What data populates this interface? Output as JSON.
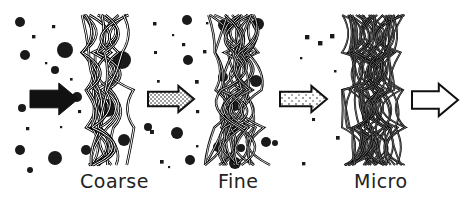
{
  "diagram": {
    "stages": [
      {
        "name": "Coarse",
        "label": "Coarse",
        "density": "coarse"
      },
      {
        "name": "Fine",
        "label": "Fine",
        "density": "fine"
      },
      {
        "name": "Micro",
        "label": "Micro",
        "density": "micro"
      }
    ],
    "arrows": [
      {
        "name": "input-flow",
        "fill": "solid"
      },
      {
        "name": "after-coarse-flow",
        "fill": "dotted-dense"
      },
      {
        "name": "after-fine-flow",
        "fill": "dotted-sparse"
      },
      {
        "name": "output-flow",
        "fill": "empty"
      }
    ],
    "colors": {
      "ink": "#1a1a1a",
      "background": "#ffffff"
    }
  }
}
